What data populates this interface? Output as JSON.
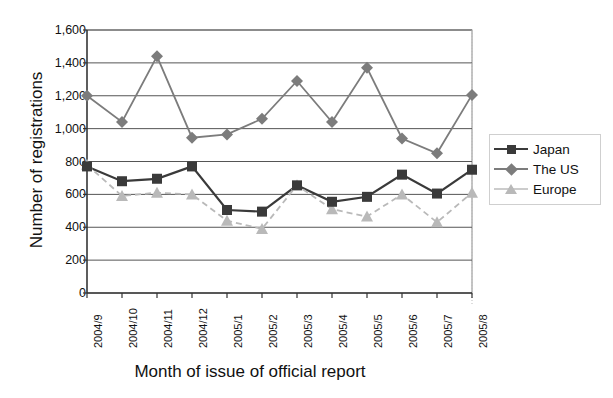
{
  "chart_data": {
    "type": "line",
    "title": "",
    "xlabel": "Month of issue of official report",
    "ylabel": "Number of registrations",
    "categories": [
      "2004/9",
      "2004/10",
      "2004/11",
      "2004/12",
      "2005/1",
      "2005/2",
      "2005/3",
      "2005/4",
      "2005/5",
      "2005/6",
      "2005/7",
      "2005/8"
    ],
    "ylim": [
      0,
      1600
    ],
    "ytick_labels": [
      "0",
      "200",
      "400",
      "600",
      "800",
      "1,000",
      "1,200",
      "1,400",
      "1,600"
    ],
    "ytick_values": [
      0,
      200,
      400,
      600,
      800,
      1000,
      1200,
      1400,
      1600
    ],
    "grid": true,
    "legend_position": "right",
    "series": [
      {
        "name": "Japan",
        "color": "#3a3a3a",
        "marker": "square",
        "linestyle": "solid",
        "values": [
          770,
          680,
          695,
          770,
          505,
          495,
          655,
          555,
          585,
          720,
          605,
          750
        ]
      },
      {
        "name": "The US",
        "color": "#7c7c7c",
        "marker": "diamond",
        "linestyle": "solid",
        "values": [
          1200,
          1040,
          1440,
          945,
          965,
          1060,
          1290,
          1040,
          1370,
          940,
          850,
          1205
        ]
      },
      {
        "name": "Europe",
        "color": "#b9b9b9",
        "marker": "triangle",
        "linestyle": "dashed",
        "values": [
          780,
          590,
          610,
          600,
          440,
          390,
          655,
          510,
          465,
          600,
          430,
          610
        ]
      }
    ]
  },
  "legend": {
    "items": [
      {
        "label": "Japan",
        "marker": "square-marker-icon"
      },
      {
        "label": "The US",
        "marker": "diamond-marker-icon"
      },
      {
        "label": "Europe",
        "marker": "triangle-marker-icon"
      }
    ]
  },
  "axes": {
    "y_title": "Number of registrations",
    "x_title": "Month of issue of official report"
  }
}
